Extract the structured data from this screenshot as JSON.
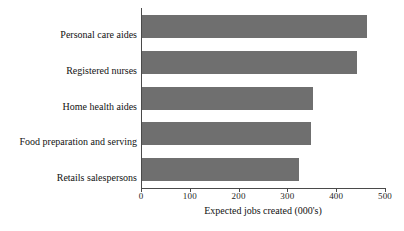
{
  "chart_data": {
    "type": "bar",
    "orientation": "horizontal",
    "title": "",
    "xlabel": "Expected jobs created (000's)",
    "ylabel": "",
    "categories": [
      "Personal care aides",
      "Registered nurses",
      "Home health aides",
      "Food preparation and serving",
      "Retails salespersons"
    ],
    "values": [
      463,
      443,
      352,
      348,
      324
    ],
    "xlim": [
      0,
      500
    ],
    "xticks": [
      0,
      100,
      200,
      300,
      400,
      500
    ],
    "xtick_labels": [
      "0",
      "100",
      "200",
      "300",
      "400",
      "500"
    ],
    "grid": false,
    "legend": null,
    "bar_color": "#6f6f6f",
    "axis_color": "#4a4a4a",
    "background_color": "#ffffff"
  }
}
